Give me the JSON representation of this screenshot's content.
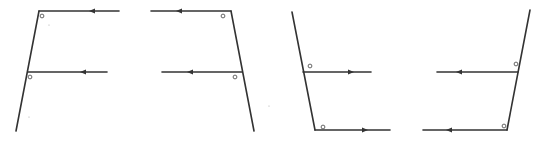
{
  "diagram": {
    "colors": {
      "line": "#333333",
      "marker": "#555555",
      "background": "#ffffff"
    },
    "figures": [
      {
        "id": "figure-1",
        "transversal": {
          "x1": 39,
          "y1": 11,
          "x2": 16,
          "y2": 131
        },
        "rays": [
          {
            "x1": 39,
            "y1": 11,
            "x2": 119,
            "y2": 11,
            "arrow_x": 92,
            "arrow_dir": "left"
          },
          {
            "x1": 28,
            "y1": 72,
            "x2": 107,
            "y2": 72,
            "arrow_x": 83,
            "arrow_dir": "left"
          }
        ],
        "angle_markers": [
          {
            "cx": 42,
            "cy": 16
          },
          {
            "cx": 30,
            "cy": 77
          }
        ]
      },
      {
        "id": "figure-2",
        "transversal": {
          "x1": 231,
          "y1": 11,
          "x2": 254,
          "y2": 131
        },
        "rays": [
          {
            "x1": 151,
            "y1": 11,
            "x2": 231,
            "y2": 11,
            "arrow_x": 179,
            "arrow_dir": "left"
          },
          {
            "x1": 162,
            "y1": 72,
            "x2": 242,
            "y2": 72,
            "arrow_x": 190,
            "arrow_dir": "left"
          }
        ],
        "angle_markers": [
          {
            "cx": 223,
            "cy": 16
          },
          {
            "cx": 235,
            "cy": 77
          }
        ]
      },
      {
        "id": "figure-3",
        "transversal": {
          "x1": 292,
          "y1": 12,
          "x2": 315,
          "y2": 130
        },
        "rays": [
          {
            "x1": 303,
            "y1": 72,
            "x2": 371,
            "y2": 72,
            "arrow_x": 351,
            "arrow_dir": "right"
          },
          {
            "x1": 315,
            "y1": 130,
            "x2": 390,
            "y2": 130,
            "arrow_x": 365,
            "arrow_dir": "right"
          }
        ],
        "angle_markers": [
          {
            "cx": 310,
            "cy": 66
          },
          {
            "cx": 323,
            "cy": 127
          }
        ]
      },
      {
        "id": "figure-4",
        "transversal": {
          "x1": 530,
          "y1": 10,
          "x2": 507,
          "y2": 130
        },
        "rays": [
          {
            "x1": 437,
            "y1": 72,
            "x2": 518,
            "y2": 72,
            "arrow_x": 459,
            "arrow_dir": "left"
          },
          {
            "x1": 423,
            "y1": 130,
            "x2": 507,
            "y2": 130,
            "arrow_x": 449,
            "arrow_dir": "left"
          }
        ],
        "angle_markers": [
          {
            "cx": 516,
            "cy": 64
          },
          {
            "cx": 504,
            "cy": 126
          }
        ]
      }
    ],
    "specks": [
      {
        "cx": 49,
        "cy": 25
      },
      {
        "cx": 29,
        "cy": 117
      },
      {
        "cx": 269,
        "cy": 106
      }
    ]
  }
}
